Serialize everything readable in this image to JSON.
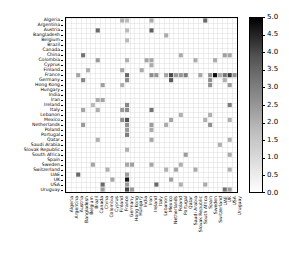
{
  "chart_data": {
    "type": "heatmap",
    "title": "",
    "xlabel": "",
    "ylabel": "",
    "colorbar": {
      "min": 0.0,
      "max": 5.0,
      "ticks": [
        0.0,
        0.5,
        1.0,
        1.5,
        2.0,
        2.5,
        3.0,
        3.5,
        4.0,
        4.5,
        5.0
      ],
      "tick_labels": [
        "0.0",
        "0.5",
        "1.0",
        "1.5",
        "2.0",
        "2.5",
        "3.0",
        "3.5",
        "4.0",
        "4.5",
        "5.0"
      ],
      "colormap": "Greys",
      "position": "right"
    },
    "grid": true,
    "categories": [
      "Algeria",
      "Argentina",
      "Austria",
      "Bangladesh",
      "Belgium",
      "Brazil",
      "Canada",
      "China",
      "Colombia",
      "Cyprus",
      "Finland",
      "France",
      "Germany",
      "Hong Kong",
      "Hungary",
      "India",
      "Iran",
      "Ireland",
      "Italy",
      "Lebanon",
      "Mexico",
      "Netherlands",
      "Poland",
      "Portugal",
      "Qatar",
      "Saudi Arabia",
      "Slovak Republic",
      "South Africa",
      "Spain",
      "Sweden",
      "Switzerland",
      "UAE",
      "UK",
      "USA",
      "Uruguay"
    ],
    "xticklabels": [
      "Algeria",
      "Argentina",
      "Austria",
      "Bangladesh",
      "Belgium",
      "Brazil",
      "Canada",
      "China",
      "Colombia",
      "Cyprus",
      "Finland",
      "France",
      "Germany",
      "Hong Kong",
      "Hungary",
      "India",
      "Iran",
      "Ireland",
      "Italy",
      "Lebanon",
      "Mexico",
      "Netherlands",
      "Poland",
      "Portugal",
      "Qatar",
      "Saudi Arabia",
      "Slovak Republic",
      "South Africa",
      "Spain",
      "Sweden",
      "Switzerland",
      "UAE",
      "UK",
      "USA",
      "Uruguay"
    ],
    "yticklabels": [
      "Algeria",
      "Argentina",
      "Austria",
      "Bangladesh",
      "Belgium",
      "Brazil",
      "Canada",
      "China",
      "Colombia",
      "Cyprus",
      "Finland",
      "France",
      "Germany",
      "Hong Kong",
      "Hungary",
      "India",
      "Iran",
      "Ireland",
      "Italy",
      "Lebanon",
      "Mexico",
      "Netherlands",
      "Poland",
      "Portugal",
      "Qatar",
      "Saudi Arabia",
      "Slovak Republic",
      "South Africa",
      "Spain",
      "Sweden",
      "Switzerland",
      "UAE",
      "UK",
      "USA",
      "Uruguay"
    ],
    "points": [
      [
        2,
        11,
        1.4
      ],
      [
        2,
        31,
        2.6
      ],
      [
        3,
        7,
        2.4
      ],
      [
        3,
        12,
        2.0
      ],
      [
        3,
        18,
        1.4
      ],
      [
        3,
        21,
        1.6
      ],
      [
        4,
        10,
        1.2
      ],
      [
        5,
        17,
        1.0
      ],
      [
        5,
        29,
        1.4
      ],
      [
        6,
        2,
        2.6
      ],
      [
        6,
        8,
        1.6
      ],
      [
        6,
        16,
        1.3
      ],
      [
        6,
        18,
        1.2
      ],
      [
        6,
        24,
        1.2
      ],
      [
        7,
        13,
        1.5
      ],
      [
        7,
        16,
        1.4
      ],
      [
        7,
        33,
        2.6
      ],
      [
        7,
        34,
        1.6
      ],
      [
        8,
        30,
        1.2
      ],
      [
        9,
        32,
        1.4
      ],
      [
        11,
        0,
        1.2
      ],
      [
        11,
        10,
        1.4
      ],
      [
        11,
        13,
        1.2
      ],
      [
        11,
        18,
        1.6
      ],
      [
        11,
        20,
        1.8
      ],
      [
        12,
        0,
        1.0
      ],
      [
        12,
        2,
        1.0
      ],
      [
        12,
        4,
        1.0
      ],
      [
        12,
        8,
        1.2
      ],
      [
        12,
        11,
        2.6
      ],
      [
        12,
        12,
        1.9
      ],
      [
        12,
        17,
        2.0
      ],
      [
        12,
        18,
        1.9
      ],
      [
        12,
        20,
        3.1
      ],
      [
        12,
        21,
        1.8
      ],
      [
        12,
        22,
        1.6
      ],
      [
        12,
        23,
        2.2
      ],
      [
        12,
        26,
        1.2
      ],
      [
        12,
        29,
        1.4
      ],
      [
        12,
        31,
        1.6
      ],
      [
        12,
        32,
        4.4
      ],
      [
        12,
        33,
        1.6
      ],
      [
        12,
        34,
        3.4
      ],
      [
        13,
        29,
        1.5
      ],
      [
        13,
        34,
        1.6
      ],
      [
        15,
        10,
        1.3
      ],
      [
        16,
        8,
        1.4
      ],
      [
        17,
        0,
        1.3
      ],
      [
        17,
        2,
        2.8
      ],
      [
        17,
        8,
        1.4
      ],
      [
        17,
        9,
        1.3
      ],
      [
        17,
        11,
        1.9
      ],
      [
        17,
        18,
        2.4
      ],
      [
        17,
        21,
        1.6
      ],
      [
        17,
        22,
        1.3
      ],
      [
        17,
        24,
        1.4
      ],
      [
        17,
        29,
        1.4
      ],
      [
        18,
        11,
        1.7
      ],
      [
        18,
        33,
        2.6
      ],
      [
        20,
        3,
        1.3
      ],
      [
        20,
        11,
        1.4
      ],
      [
        20,
        21,
        1.3
      ],
      [
        20,
        30,
        1.2
      ],
      [
        21,
        11,
        3.3
      ],
      [
        21,
        12,
        2.9
      ],
      [
        21,
        20,
        1.4
      ],
      [
        21,
        32,
        1.5
      ],
      [
        22,
        11,
        1.6
      ],
      [
        22,
        30,
        1.4
      ],
      [
        23,
        7,
        1.3
      ],
      [
        23,
        11,
        1.7
      ],
      [
        23,
        19,
        1.2
      ],
      [
        23,
        29,
        1.2
      ],
      [
        23,
        33,
        1.2
      ],
      [
        24,
        11,
        2.2
      ],
      [
        24,
        27,
        1.6
      ],
      [
        26,
        8,
        1.3
      ],
      [
        26,
        30,
        1.3
      ],
      [
        27,
        11,
        1.4
      ],
      [
        28,
        0,
        2.6
      ],
      [
        28,
        20,
        1.2
      ],
      [
        28,
        33,
        1.3
      ],
      [
        29,
        11,
        1.8
      ],
      [
        29,
        12,
        1.8
      ],
      [
        29,
        13,
        1.8
      ],
      [
        29,
        19,
        1.2
      ],
      [
        29,
        21,
        1.8
      ],
      [
        30,
        8,
        1.3
      ],
      [
        30,
        11,
        4.7
      ],
      [
        31,
        11,
        1.3
      ],
      [
        31,
        25,
        1.2
      ],
      [
        32,
        7,
        1.5
      ],
      [
        32,
        11,
        2.4
      ],
      [
        32,
        12,
        1.2
      ],
      [
        32,
        34,
        2.4
      ],
      [
        33,
        7,
        1.4
      ],
      [
        33,
        11,
        3.6
      ],
      [
        33,
        13,
        1.6
      ],
      [
        33,
        17,
        2.2
      ],
      [
        33,
        20,
        1.2
      ],
      [
        33,
        24,
        1.2
      ],
      [
        33,
        27,
        1.3
      ],
      [
        33,
        30,
        1.2
      ],
      [
        33,
        34,
        1.6
      ],
      [
        34,
        11,
        1.8
      ]
    ]
  },
  "figure": {
    "background_color": "#ffffff",
    "axes_edge_color": "#000000",
    "grid_color": "#cccccc"
  }
}
